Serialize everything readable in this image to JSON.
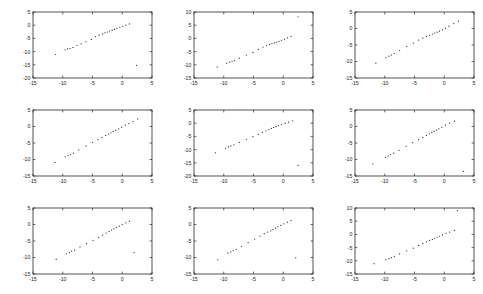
{
  "figure": {
    "title": "",
    "rows": 3,
    "cols": 3,
    "background_color": "#ffffff",
    "axis_color": "#2a2a2a",
    "marker_color": "#2b2b2b"
  },
  "chart_data": [
    {
      "type": "scatter",
      "id": "subplot-1",
      "title": "",
      "xlabel": "",
      "ylabel": "",
      "xlim": [
        -15,
        5
      ],
      "ylim": [
        -20,
        5
      ],
      "xticks": [
        -15,
        -10,
        -5,
        0,
        5
      ],
      "yticks": [
        -20,
        -15,
        -10,
        -5,
        0,
        5
      ],
      "xtick_labels": [
        "-15",
        "-10",
        "-5",
        "0",
        "5"
      ],
      "ytick_labels": [
        "-20",
        "-15",
        "-10",
        "-5",
        "0",
        "5"
      ],
      "grid": false,
      "legend": null,
      "x": [
        -11.2,
        -9.6,
        -9.2,
        -8.8,
        -8.3,
        -7.6,
        -6.9,
        -6.1,
        -5.2,
        -4.5,
        -3.9,
        -3.3,
        -2.9,
        -2.5,
        -2.1,
        -1.7,
        -1.3,
        -0.9,
        -0.4,
        0.1,
        0.6,
        1.2,
        2.4
      ],
      "y": [
        -11.1,
        -9.3,
        -9.0,
        -8.8,
        -8.4,
        -7.6,
        -7.1,
        -6.3,
        -5.4,
        -4.3,
        -3.8,
        -3.3,
        -2.9,
        -2.6,
        -2.2,
        -1.9,
        -1.6,
        -1.2,
        -0.8,
        -0.4,
        0.0,
        0.5,
        -15.2
      ]
    },
    {
      "type": "scatter",
      "id": "subplot-2",
      "title": "",
      "xlabel": "",
      "ylabel": "",
      "xlim": [
        -15,
        5
      ],
      "ylim": [
        -15,
        10
      ],
      "xticks": [
        -15,
        -10,
        -5,
        0,
        5
      ],
      "yticks": [
        -15,
        -10,
        -5,
        0,
        5,
        10
      ],
      "xtick_labels": [
        "-15",
        "-10",
        "-5",
        "0",
        "5"
      ],
      "ytick_labels": [
        "-15",
        "-10",
        "-5",
        "0",
        "5",
        "10"
      ],
      "grid": false,
      "legend": null,
      "x": [
        -11.1,
        -9.5,
        -9.0,
        -8.6,
        -8.2,
        -7.4,
        -6.2,
        -5.1,
        -4.2,
        -3.4,
        -2.8,
        -2.3,
        -1.9,
        -1.5,
        -1.1,
        -0.7,
        -0.3,
        0.2,
        0.7,
        1.3,
        2.5
      ],
      "y": [
        -10.8,
        -9.4,
        -9.0,
        -8.7,
        -8.4,
        -7.5,
        -6.3,
        -5.3,
        -4.2,
        -3.3,
        -2.7,
        -2.4,
        -2.0,
        -1.7,
        -1.4,
        -1.1,
        -0.7,
        -0.3,
        0.2,
        0.8,
        8.2
      ]
    },
    {
      "type": "scatter",
      "id": "subplot-3",
      "title": "",
      "xlabel": "",
      "ylabel": "",
      "xlim": [
        -15,
        5
      ],
      "ylim": [
        -15,
        5
      ],
      "xticks": [
        -15,
        -10,
        -5,
        0,
        5
      ],
      "yticks": [
        -15,
        -10,
        -5,
        0,
        5
      ],
      "xtick_labels": [
        "-15",
        "-10",
        "-5",
        "0",
        "5"
      ],
      "ytick_labels": [
        "-15",
        "-10",
        "-5",
        "0",
        "5"
      ],
      "grid": false,
      "legend": null,
      "x": [
        -11.5,
        -9.8,
        -9.3,
        -8.9,
        -8.4,
        -7.5,
        -6.3,
        -5.2,
        -4.3,
        -3.6,
        -3.0,
        -2.5,
        -2.0,
        -1.6,
        -1.2,
        -0.8,
        -0.3,
        0.2,
        0.8,
        1.6,
        2.4
      ],
      "y": [
        -10.5,
        -8.8,
        -8.4,
        -8.0,
        -7.6,
        -6.7,
        -5.4,
        -4.4,
        -3.5,
        -2.9,
        -2.4,
        -2.0,
        -1.7,
        -1.4,
        -1.1,
        -0.8,
        -0.4,
        0.1,
        0.7,
        1.5,
        2.2
      ]
    },
    {
      "type": "scatter",
      "id": "subplot-4",
      "title": "",
      "xlabel": "",
      "ylabel": "",
      "xlim": [
        -15,
        5
      ],
      "ylim": [
        -15,
        5
      ],
      "xticks": [
        -15,
        -10,
        -5,
        0,
        5
      ],
      "yticks": [
        -15,
        -10,
        -5,
        0,
        5
      ],
      "xtick_labels": [
        "-15",
        "-10",
        "-5",
        "0",
        "5"
      ],
      "ytick_labels": [
        "-15",
        "-10",
        "-5",
        "0",
        "5"
      ],
      "grid": false,
      "legend": null,
      "x": [
        -11.3,
        -9.6,
        -9.1,
        -8.7,
        -8.2,
        -7.3,
        -6.1,
        -5.0,
        -4.1,
        -3.4,
        -2.8,
        -2.3,
        -1.9,
        -1.5,
        -1.1,
        -0.6,
        -0.1,
        0.5,
        1.1,
        1.8,
        2.6
      ],
      "y": [
        -10.9,
        -9.2,
        -8.8,
        -8.5,
        -8.1,
        -7.1,
        -5.9,
        -4.8,
        -4.0,
        -3.3,
        -2.7,
        -2.3,
        -1.9,
        -1.5,
        -1.1,
        -0.7,
        -0.2,
        0.4,
        0.9,
        1.5,
        2.3
      ]
    },
    {
      "type": "scatter",
      "id": "subplot-5",
      "title": "",
      "xlabel": "",
      "ylabel": "",
      "xlim": [
        -15,
        5
      ],
      "ylim": [
        -20,
        5
      ],
      "xticks": [
        -15,
        -10,
        -5,
        0,
        5
      ],
      "yticks": [
        -20,
        -15,
        -10,
        -5,
        0,
        5
      ],
      "xtick_labels": [
        "-15",
        "-10",
        "-5",
        "0",
        "5"
      ],
      "ytick_labels": [
        "-20",
        "-15",
        "-10",
        "-5",
        "0",
        "5"
      ],
      "grid": false,
      "legend": null,
      "x": [
        -11.4,
        -9.7,
        -9.2,
        -8.8,
        -8.3,
        -7.4,
        -6.2,
        -5.1,
        -4.2,
        -3.5,
        -2.9,
        -2.4,
        -2.0,
        -1.6,
        -1.2,
        -0.8,
        -0.3,
        0.3,
        0.9,
        1.6,
        2.5
      ],
      "y": [
        -11.2,
        -9.5,
        -9.0,
        -8.6,
        -8.2,
        -7.3,
        -6.1,
        -5.1,
        -4.2,
        -3.4,
        -2.9,
        -2.4,
        -2.0,
        -1.6,
        -1.3,
        -0.9,
        -0.5,
        0.0,
        0.4,
        0.9,
        -16.0
      ]
    },
    {
      "type": "scatter",
      "id": "subplot-6",
      "title": "",
      "xlabel": "",
      "ylabel": "",
      "xlim": [
        -15,
        5
      ],
      "ylim": [
        -15,
        5
      ],
      "xticks": [
        -15,
        -10,
        -5,
        0,
        5
      ],
      "yticks": [
        -15,
        -10,
        -5,
        0,
        5
      ],
      "xtick_labels": [
        "-15",
        "-10",
        "-5",
        "0",
        "5"
      ],
      "ytick_labels": [
        "-15",
        "-10",
        "-5",
        "0",
        "5"
      ],
      "grid": false,
      "legend": null,
      "x": [
        -12.0,
        -9.9,
        -9.4,
        -9.0,
        -8.5,
        -7.6,
        -6.4,
        -5.3,
        -4.3,
        -3.6,
        -3.0,
        -2.5,
        -2.1,
        -1.7,
        -1.3,
        -0.9,
        -0.4,
        0.2,
        0.9,
        1.7,
        3.2
      ],
      "y": [
        -11.3,
        -9.3,
        -8.9,
        -8.5,
        -8.1,
        -7.2,
        -6.0,
        -4.9,
        -4.0,
        -3.3,
        -2.7,
        -2.2,
        -1.8,
        -1.5,
        -1.1,
        -0.7,
        -0.2,
        0.4,
        1.0,
        1.6,
        -13.6
      ]
    },
    {
      "type": "scatter",
      "id": "subplot-7",
      "title": "",
      "xlabel": "",
      "ylabel": "",
      "xlim": [
        -15,
        5
      ],
      "ylim": [
        -15,
        5
      ],
      "xticks": [
        -15,
        -10,
        -5,
        0,
        5
      ],
      "yticks": [
        -15,
        -10,
        -5,
        0,
        5
      ],
      "xtick_labels": [
        "-15",
        "-10",
        "-5",
        "0",
        "5"
      ],
      "ytick_labels": [
        "-15",
        "-10",
        "-5",
        "0",
        "5"
      ],
      "grid": false,
      "legend": null,
      "x": [
        -11.1,
        -9.4,
        -8.9,
        -8.5,
        -8.0,
        -7.1,
        -6.0,
        -4.9,
        -4.0,
        -3.3,
        -2.7,
        -2.2,
        -1.8,
        -1.4,
        -1.0,
        -0.5,
        0.0,
        0.6,
        1.2,
        2.0
      ],
      "y": [
        -10.6,
        -8.9,
        -8.5,
        -8.1,
        -7.8,
        -6.8,
        -5.8,
        -4.8,
        -3.9,
        -3.2,
        -2.6,
        -2.1,
        -1.7,
        -1.3,
        -0.9,
        -0.5,
        0.0,
        0.5,
        1.0,
        -8.5
      ]
    },
    {
      "type": "scatter",
      "id": "subplot-8",
      "title": "",
      "xlabel": "",
      "ylabel": "",
      "xlim": [
        -15,
        5
      ],
      "ylim": [
        -15,
        5
      ],
      "xticks": [
        -15,
        -10,
        -5,
        0,
        5
      ],
      "yticks": [
        -15,
        -10,
        -5,
        0,
        5
      ],
      "xtick_labels": [
        "-15",
        "-10",
        "-5",
        "0",
        "5"
      ],
      "ytick_labels": [
        "-15",
        "-10",
        "-5",
        "0",
        "5"
      ],
      "grid": false,
      "legend": null,
      "x": [
        -11.0,
        -9.3,
        -8.8,
        -8.4,
        -7.9,
        -7.0,
        -5.9,
        -4.8,
        -3.9,
        -3.2,
        -2.6,
        -2.1,
        -1.7,
        -1.3,
        -0.9,
        -0.4,
        0.1,
        0.7,
        1.3,
        2.1
      ],
      "y": [
        -10.7,
        -8.7,
        -8.3,
        -7.9,
        -7.5,
        -6.6,
        -5.5,
        -4.4,
        -3.5,
        -2.8,
        -2.3,
        -1.9,
        -1.5,
        -1.1,
        -0.7,
        -0.3,
        0.2,
        0.7,
        1.2,
        -10.1
      ]
    },
    {
      "type": "scatter",
      "id": "subplot-9",
      "title": "",
      "xlabel": "",
      "ylabel": "",
      "xlim": [
        -15,
        5
      ],
      "ylim": [
        -15,
        10
      ],
      "xticks": [
        -15,
        -10,
        -5,
        0,
        5
      ],
      "yticks": [
        -15,
        -10,
        -5,
        0,
        5,
        10
      ],
      "xtick_labels": [
        "-15",
        "-10",
        "-5",
        "0",
        "5"
      ],
      "ytick_labels": [
        "-15",
        "-10",
        "-5",
        "0",
        "5",
        "10"
      ],
      "grid": false,
      "legend": null,
      "x": [
        -11.8,
        -9.8,
        -9.3,
        -8.9,
        -8.4,
        -7.5,
        -6.3,
        -5.2,
        -4.3,
        -3.6,
        -3.0,
        -2.5,
        -2.0,
        -1.6,
        -1.2,
        -0.8,
        -0.3,
        0.3,
        0.9,
        1.7,
        2.2
      ],
      "y": [
        -11.1,
        -9.6,
        -9.2,
        -8.8,
        -8.4,
        -7.4,
        -6.2,
        -5.2,
        -4.2,
        -3.4,
        -2.8,
        -2.3,
        -1.9,
        -1.5,
        -1.1,
        -0.7,
        -0.2,
        0.4,
        0.9,
        1.5,
        9.0
      ]
    }
  ]
}
